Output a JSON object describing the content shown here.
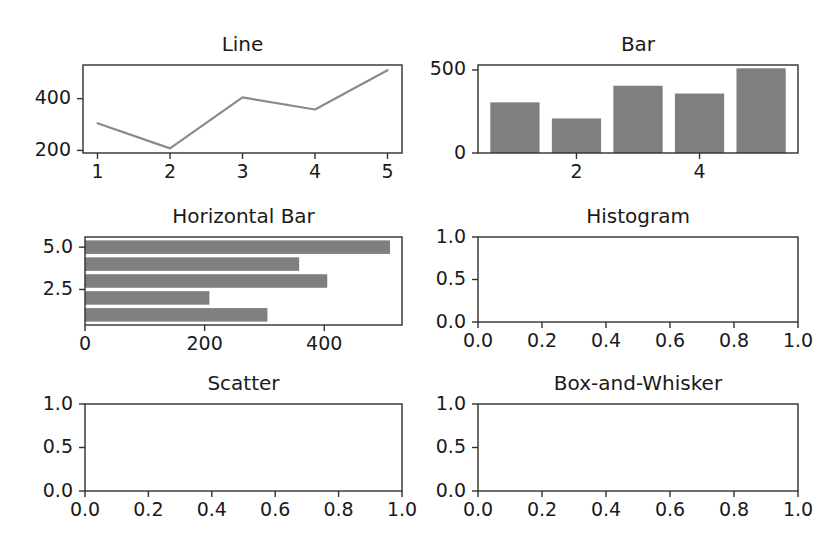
{
  "figure": {
    "width": 839,
    "height": 557,
    "background": "#ffffff",
    "rows": 3,
    "cols": 2,
    "bar_color": "#7f7f7f",
    "line_color": "#8a8a8a",
    "axis_color": "#303030",
    "text_color": "#1a1a1a"
  },
  "chart_data": [
    {
      "type": "line",
      "title": "Line",
      "xlabel": "",
      "ylabel": "",
      "x": [
        1,
        2,
        3,
        4,
        5
      ],
      "values": [
        305,
        208,
        405,
        358,
        510
      ],
      "xlim": [
        0.8,
        5.2
      ],
      "ylim": [
        190,
        530
      ],
      "xticks": [
        1,
        2,
        3,
        4,
        5
      ],
      "xticklabels": [
        "1",
        "2",
        "3",
        "4",
        "5"
      ],
      "yticks": [
        200,
        400
      ],
      "yticklabels": [
        "200",
        "400"
      ],
      "grid": false,
      "legend": "none"
    },
    {
      "type": "bar",
      "title": "Bar",
      "xlabel": "",
      "ylabel": "",
      "categories": [
        1,
        2,
        3,
        4,
        5
      ],
      "values": [
        305,
        208,
        405,
        358,
        510
      ],
      "xlim": [
        0.4,
        5.6
      ],
      "ylim": [
        0,
        530
      ],
      "xticks": [
        2,
        4
      ],
      "xticklabels": [
        "2",
        "4"
      ],
      "yticks": [
        0,
        500
      ],
      "yticklabels": [
        "0",
        "500"
      ],
      "bar_width": 0.8,
      "grid": false,
      "legend": "none"
    },
    {
      "type": "barh",
      "title": "Horizontal Bar",
      "xlabel": "",
      "ylabel": "",
      "categories": [
        1,
        2,
        3,
        4,
        5
      ],
      "values": [
        305,
        208,
        405,
        358,
        510
      ],
      "xlim": [
        0,
        530
      ],
      "ylim": [
        0.4,
        5.6
      ],
      "xticks": [
        0,
        200,
        400
      ],
      "xticklabels": [
        "0",
        "200",
        "400"
      ],
      "yticks": [
        2.5,
        5.0
      ],
      "yticklabels": [
        "2.5",
        "5.0"
      ],
      "bar_height": 0.8,
      "grid": false,
      "legend": "none"
    },
    {
      "type": "histogram",
      "title": "Histogram",
      "xlabel": "",
      "ylabel": "",
      "values": [],
      "xlim": [
        0.0,
        1.0
      ],
      "ylim": [
        0.0,
        1.0
      ],
      "xticks": [
        0.0,
        0.2,
        0.4,
        0.6,
        0.8,
        1.0
      ],
      "xticklabels": [
        "0.0",
        "0.2",
        "0.4",
        "0.6",
        "0.8",
        "1.0"
      ],
      "yticks": [
        0.0,
        0.5,
        1.0
      ],
      "yticklabels": [
        "0.0",
        "0.5",
        "1.0"
      ],
      "grid": false,
      "legend": "none",
      "empty": true
    },
    {
      "type": "scatter",
      "title": "Scatter",
      "xlabel": "",
      "ylabel": "",
      "x": [],
      "values": [],
      "xlim": [
        0.0,
        1.0
      ],
      "ylim": [
        0.0,
        1.0
      ],
      "xticks": [
        0.0,
        0.2,
        0.4,
        0.6,
        0.8,
        1.0
      ],
      "xticklabels": [
        "0.0",
        "0.2",
        "0.4",
        "0.6",
        "0.8",
        "1.0"
      ],
      "yticks": [
        0.0,
        0.5,
        1.0
      ],
      "yticklabels": [
        "0.0",
        "0.5",
        "1.0"
      ],
      "grid": false,
      "legend": "none",
      "empty": true
    },
    {
      "type": "box",
      "title": "Box-and-Whisker",
      "xlabel": "",
      "ylabel": "",
      "values": [],
      "xlim": [
        0.0,
        1.0
      ],
      "ylim": [
        0.0,
        1.0
      ],
      "xticks": [
        0.0,
        0.2,
        0.4,
        0.6,
        0.8,
        1.0
      ],
      "xticklabels": [
        "0.0",
        "0.2",
        "0.4",
        "0.6",
        "0.8",
        "1.0"
      ],
      "yticks": [
        0.0,
        0.5,
        1.0
      ],
      "yticklabels": [
        "0.0",
        "0.5",
        "1.0"
      ],
      "grid": false,
      "legend": "none",
      "empty": true
    }
  ],
  "layout": {
    "panels": [
      {
        "name": "line-subplot",
        "left": 83,
        "top": 65,
        "width": 319,
        "height": 88
      },
      {
        "name": "bar-subplot",
        "left": 478,
        "top": 65,
        "width": 320,
        "height": 88
      },
      {
        "name": "horizontal-bar-subplot",
        "left": 85,
        "top": 237,
        "width": 317,
        "height": 88
      },
      {
        "name": "histogram-subplot",
        "left": 478,
        "top": 237,
        "width": 320,
        "height": 85
      },
      {
        "name": "scatter-subplot",
        "left": 85,
        "top": 404,
        "width": 317,
        "height": 87
      },
      {
        "name": "box-subplot",
        "left": 478,
        "top": 404,
        "width": 320,
        "height": 87
      }
    ],
    "tick_length": 6,
    "title_offset": 14
  }
}
